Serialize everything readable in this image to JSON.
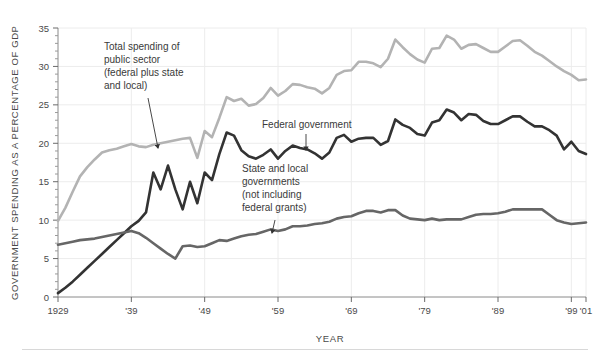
{
  "figure": {
    "background_color": "#ffffff",
    "bottom_rule_color": "#d8d8d8"
  },
  "chart_data": {
    "type": "line",
    "title": "",
    "xlabel": "YEAR",
    "ylabel": "GOVERNMENT SPENDING AS A PERCENTAGE OF GDP",
    "xlim": [
      1929,
      2001
    ],
    "ylim": [
      0,
      35
    ],
    "grid": true,
    "grid_color": "#ececec",
    "legend_position": "inline-annotations",
    "ytick_labels": [
      "0",
      "5",
      "10",
      "15",
      "20",
      "25",
      "30",
      "35"
    ],
    "ytick_values": [
      0,
      5,
      10,
      15,
      20,
      25,
      30,
      35
    ],
    "yminor_step": 1,
    "xtick_labels": [
      "1929",
      "'39",
      "'49",
      "'59",
      "'69",
      "'79",
      "'89",
      "'99",
      "'01"
    ],
    "xtick_values": [
      1929,
      1939,
      1949,
      1959,
      1969,
      1979,
      1989,
      1999,
      2001
    ],
    "x": [
      1929,
      1930,
      1931,
      1932,
      1933,
      1934,
      1935,
      1936,
      1937,
      1938,
      1939,
      1940,
      1941,
      1942,
      1943,
      1944,
      1945,
      1946,
      1947,
      1948,
      1949,
      1950,
      1951,
      1952,
      1953,
      1954,
      1955,
      1956,
      1957,
      1958,
      1959,
      1960,
      1961,
      1962,
      1963,
      1964,
      1965,
      1966,
      1967,
      1968,
      1969,
      1970,
      1971,
      1972,
      1973,
      1974,
      1975,
      1976,
      1977,
      1978,
      1979,
      1980,
      1981,
      1982,
      1983,
      1984,
      1985,
      1986,
      1987,
      1988,
      1989,
      1990,
      1991,
      1992,
      1993,
      1994,
      1995,
      1996,
      1997,
      1998,
      1999,
      2000,
      2001
    ],
    "series": [
      {
        "name": "Total spending of public sector (federal plus state and local)",
        "color": "#b3b3b3",
        "linewidth": 2.6,
        "values": [
          9.9,
          11.6,
          13.7,
          15.7,
          16.9,
          17.9,
          18.8,
          19.1,
          19.3,
          19.6,
          19.9,
          19.6,
          19.5,
          19.8,
          20.0,
          20.2,
          20.4,
          20.6,
          20.7,
          18.1,
          21.6,
          20.8,
          23.3,
          26.0,
          25.5,
          25.8,
          24.9,
          25.1,
          25.9,
          27.2,
          26.2,
          26.8,
          27.7,
          27.6,
          27.3,
          27.1,
          26.5,
          27.2,
          28.9,
          29.4,
          29.5,
          30.6,
          30.6,
          30.4,
          29.9,
          31.0,
          33.5,
          32.5,
          31.6,
          30.9,
          30.5,
          32.3,
          32.4,
          34.0,
          33.5,
          32.3,
          32.8,
          32.9,
          32.4,
          31.9,
          31.9,
          32.6,
          33.3,
          33.4,
          32.7,
          31.9,
          31.4,
          30.7,
          30.0,
          29.4,
          28.9,
          28.2,
          28.3
        ]
      },
      {
        "name": "Federal government",
        "color": "#333333",
        "linewidth": 2.6,
        "values": [
          0.5,
          1.2,
          2.0,
          2.9,
          3.8,
          4.7,
          5.6,
          6.5,
          7.4,
          8.3,
          9.2,
          9.9,
          11.0,
          16.2,
          14.0,
          17.1,
          14.0,
          11.4,
          15.0,
          12.2,
          16.2,
          15.2,
          18.6,
          21.4,
          21.0,
          19.1,
          18.3,
          18.0,
          18.5,
          19.2,
          18.0,
          19.0,
          19.7,
          19.4,
          19.2,
          18.7,
          18.0,
          18.8,
          20.7,
          21.1,
          20.2,
          20.6,
          20.7,
          20.7,
          19.8,
          20.3,
          23.1,
          22.4,
          22.0,
          21.2,
          21.0,
          22.7,
          23.0,
          24.4,
          24.0,
          23.0,
          23.8,
          23.7,
          22.9,
          22.5,
          22.5,
          23.0,
          23.5,
          23.5,
          22.8,
          22.2,
          22.2,
          21.7,
          21.0,
          19.2,
          20.2,
          19.0,
          18.6
        ]
      },
      {
        "name": "State and local governments (not including federal grants)",
        "color": "#666666",
        "linewidth": 2.6,
        "values": [
          6.8,
          7.0,
          7.2,
          7.4,
          7.5,
          7.6,
          7.8,
          8.0,
          8.2,
          8.4,
          8.6,
          8.3,
          7.7,
          7.0,
          6.3,
          5.6,
          5.0,
          6.6,
          6.7,
          6.5,
          6.6,
          7.0,
          7.4,
          7.3,
          7.6,
          7.9,
          8.1,
          8.2,
          8.5,
          8.8,
          8.6,
          8.8,
          9.2,
          9.2,
          9.3,
          9.5,
          9.6,
          9.8,
          10.2,
          10.4,
          10.5,
          10.9,
          11.2,
          11.2,
          11.0,
          11.3,
          11.3,
          10.6,
          10.2,
          10.1,
          10.0,
          10.2,
          10.0,
          10.1,
          10.1,
          10.1,
          10.4,
          10.7,
          10.8,
          10.8,
          10.9,
          11.1,
          11.4,
          11.4,
          11.4,
          11.4,
          11.4,
          10.7,
          10.0,
          9.7,
          9.5,
          9.6,
          9.7
        ]
      }
    ],
    "annotations": [
      {
        "id": "total-spending-annotation",
        "lines": [
          "Total spending of",
          "public sector",
          "(federal plus state",
          "and local)"
        ],
        "text_x": 104,
        "text_y": 50,
        "arrow_from_x": 148,
        "arrow_from_y": 98,
        "arrow_to_x": 158,
        "arrow_to_y": 148
      },
      {
        "id": "federal-government-annotation",
        "lines": [
          "Federal government"
        ],
        "text_x": 262,
        "text_y": 128,
        "arrow_from_x": 306,
        "arrow_from_y": 134,
        "arrow_to_x": 306,
        "arrow_to_y": 150
      },
      {
        "id": "state-local-annotation",
        "lines": [
          "State and local",
          "governments",
          "(not including",
          "federal grants)"
        ],
        "text_x": 242,
        "text_y": 172,
        "arrow_from_x": 275,
        "arrow_from_y": 220,
        "arrow_to_x": 272,
        "arrow_to_y": 233
      }
    ]
  }
}
